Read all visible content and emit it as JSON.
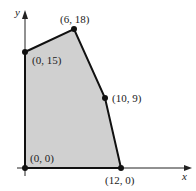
{
  "diagram": {
    "type": "feasible-region-polygon",
    "axes": {
      "x_label": "x",
      "y_label": "y"
    },
    "vertices": [
      {
        "label": "(0, 0)",
        "x": 0,
        "y": 0
      },
      {
        "label": "(0, 15)",
        "x": 0,
        "y": 15
      },
      {
        "label": "(6, 18)",
        "x": 6,
        "y": 18
      },
      {
        "label": "(10, 9)",
        "x": 10,
        "y": 9
      },
      {
        "label": "(12, 0)",
        "x": 12,
        "y": 0
      }
    ],
    "colors": {
      "region_fill": "#cfcfcf",
      "edge": "#111111",
      "axis": "#222222"
    }
  }
}
